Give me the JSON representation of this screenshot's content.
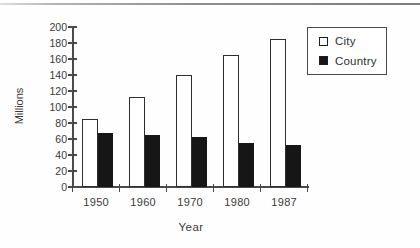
{
  "page": {
    "background": "#fefefe",
    "top_rule_color": "#8f8f8f",
    "axis_color": "#4a4a4a",
    "text_color": "#3a3a3a"
  },
  "chart_data": {
    "type": "bar",
    "title": "",
    "categories": [
      "1950",
      "1960",
      "1970",
      "1980",
      "1987"
    ],
    "series": [
      {
        "name": "City",
        "fill": "#ffffff",
        "values": [
          85,
          112,
          140,
          165,
          185
        ]
      },
      {
        "name": "Country",
        "fill": "#161616",
        "values": [
          67,
          65,
          63,
          55,
          53
        ]
      }
    ],
    "xlabel": "Year",
    "ylabel": "Millions",
    "ylim": [
      0,
      200
    ],
    "ytick_step": 20,
    "grid": false,
    "legend_position": "top-right"
  }
}
